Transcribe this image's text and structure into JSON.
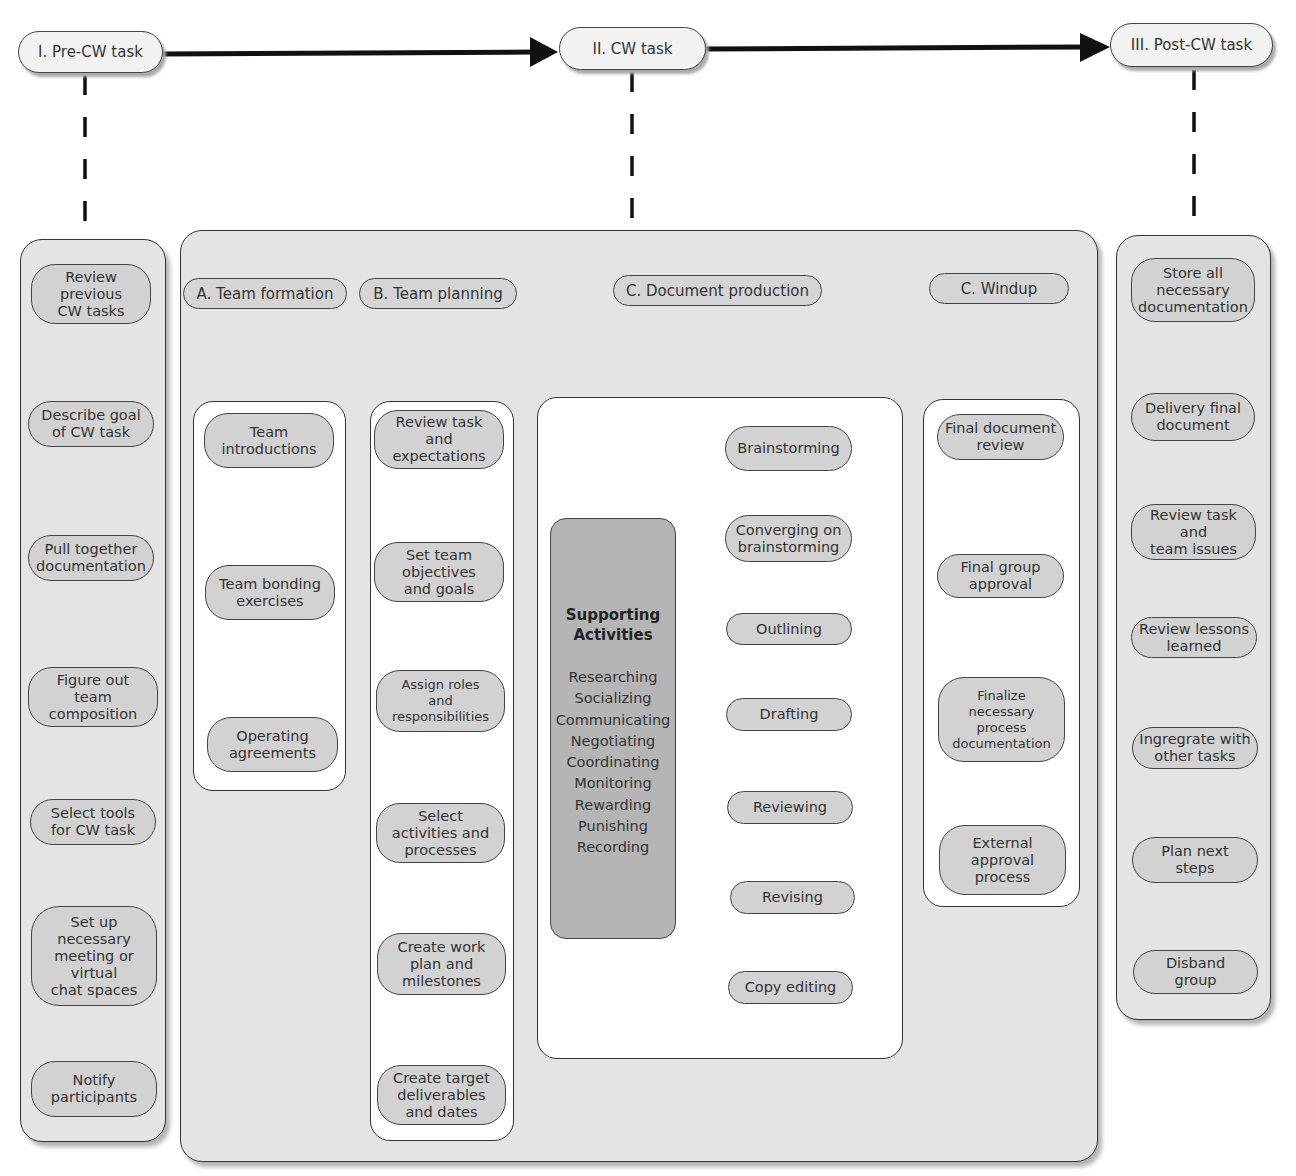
{
  "phases": [
    {
      "id": "pre",
      "label": "I. Pre-CW task"
    },
    {
      "id": "cw",
      "label": "II. CW task"
    },
    {
      "id": "post",
      "label": "III. Post-CW task"
    }
  ],
  "pre_cw": {
    "steps": [
      "Review\nprevious\nCW tasks",
      "Describe goal\nof CW task",
      "Pull together\ndocumentation",
      "Figure out\nteam\ncomposition",
      "Select tools\nfor CW task",
      "Set up\nnecessary\nmeeting or\nvirtual\nchat spaces",
      "Notify\nparticipants"
    ]
  },
  "cw": {
    "team_formation": {
      "header": "A. Team formation",
      "steps": [
        "Team\nintroductions",
        "Team bonding\nexercises",
        "Operating\nagreements"
      ]
    },
    "team_planning": {
      "header": "B. Team planning",
      "steps": [
        "Review task\nand\nexpectations",
        "Set team\nobjectives\nand goals",
        "Assign roles\nand\nresponsibilities",
        "Select\nactivities and\nprocesses",
        "Create work\nplan and\nmilestones",
        "Create target\ndeliverables\nand dates"
      ]
    },
    "document_production": {
      "header": "C. Document production",
      "supporting": {
        "title": "Supporting\nActivities",
        "items": [
          "Researching",
          "Socializing",
          "Communicating",
          "Negotiating",
          "Coordinating",
          "Monitoring",
          "Rewarding",
          "Punishing",
          "Recording"
        ]
      },
      "steps": [
        "Brainstorming",
        "Converging on\nbrainstorming",
        "Outlining",
        "Drafting",
        "Reviewing",
        "Revising",
        "Copy editing"
      ]
    },
    "windup": {
      "header": "C. Windup",
      "steps": [
        "Final document\nreview",
        "Final group\napproval",
        "Finalize\nnecessary\nprocess\ndocumentation",
        "External\napproval\nprocess"
      ]
    }
  },
  "post_cw": {
    "steps": [
      "Store all\nnecessary\ndocumentation",
      "Delivery final\ndocument",
      "Review task\nand\nteam issues",
      "Review lessons\nlearned",
      "Ingregrate with\nother tasks",
      "Plan next\nsteps",
      "Disband\ngroup"
    ]
  },
  "colors": {
    "panel_bg": "#e4e4e4",
    "node_bg": "#d2d2d2",
    "support_bg": "#b5b5b5",
    "line": "#111111"
  }
}
